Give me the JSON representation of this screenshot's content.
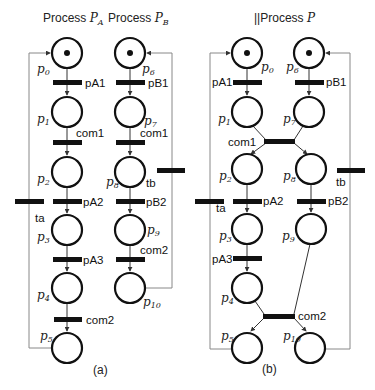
{
  "figure": {
    "panels": [
      {
        "id": "a",
        "caption": "(a)",
        "titles": [
          {
            "prefix": "Process ",
            "symbol": "P",
            "sub": "A"
          },
          {
            "prefix": "Process ",
            "symbol": "P",
            "sub": "B"
          }
        ],
        "places": [
          {
            "id": "p0",
            "sym": "p",
            "sub": "0",
            "tokens": 1
          },
          {
            "id": "p1",
            "sym": "p",
            "sub": "1",
            "tokens": 0
          },
          {
            "id": "p2",
            "sym": "p",
            "sub": "2",
            "tokens": 0
          },
          {
            "id": "p3",
            "sym": "p",
            "sub": "3",
            "tokens": 0
          },
          {
            "id": "p4",
            "sym": "p",
            "sub": "4",
            "tokens": 0
          },
          {
            "id": "p5",
            "sym": "p",
            "sub": "5",
            "tokens": 0
          },
          {
            "id": "p6",
            "sym": "p",
            "sub": "6",
            "tokens": 1
          },
          {
            "id": "p7",
            "sym": "p",
            "sub": "7",
            "tokens": 0
          },
          {
            "id": "p8",
            "sym": "p",
            "sub": "8",
            "tokens": 0
          },
          {
            "id": "p9",
            "sym": "p",
            "sub": "9",
            "tokens": 0
          },
          {
            "id": "p10",
            "sym": "p",
            "sub": "10",
            "tokens": 0
          }
        ],
        "transitions": {
          "pA1": "pA1",
          "com1_a": "com1",
          "pA2": "pA2",
          "pA3": "pA3",
          "com2_a": "com2",
          "pB1": "pB1",
          "com1_b": "com1",
          "pB2": "pB2",
          "com2_b": "com2",
          "ta": "ta",
          "tb": "tb"
        }
      },
      {
        "id": "b",
        "caption": "(b)",
        "titles": [
          {
            "prefix": "||Process ",
            "symbol": "P",
            "sub": ""
          }
        ],
        "places": [
          {
            "id": "p0",
            "sym": "p",
            "sub": "0",
            "tokens": 1
          },
          {
            "id": "p1",
            "sym": "p",
            "sub": "1",
            "tokens": 0
          },
          {
            "id": "p2",
            "sym": "p",
            "sub": "2",
            "tokens": 0
          },
          {
            "id": "p3",
            "sym": "p",
            "sub": "3",
            "tokens": 0
          },
          {
            "id": "p4",
            "sym": "p",
            "sub": "4",
            "tokens": 0
          },
          {
            "id": "p5",
            "sym": "p",
            "sub": "5",
            "tokens": 0
          },
          {
            "id": "p6",
            "sym": "p",
            "sub": "6",
            "tokens": 1
          },
          {
            "id": "p7",
            "sym": "p",
            "sub": "7",
            "tokens": 0
          },
          {
            "id": "p8",
            "sym": "p",
            "sub": "8",
            "tokens": 0
          },
          {
            "id": "p9",
            "sym": "p",
            "sub": "9",
            "tokens": 0
          },
          {
            "id": "p10",
            "sym": "p",
            "sub": "10",
            "tokens": 0
          }
        ],
        "transitions": {
          "pA1": "pA1",
          "com1": "com1",
          "pA2": "pA2",
          "pA3": "pA3",
          "com2": "com2",
          "pB1": "pB1",
          "pB2": "pB2",
          "ta": "ta",
          "tb": "tb"
        }
      }
    ]
  }
}
